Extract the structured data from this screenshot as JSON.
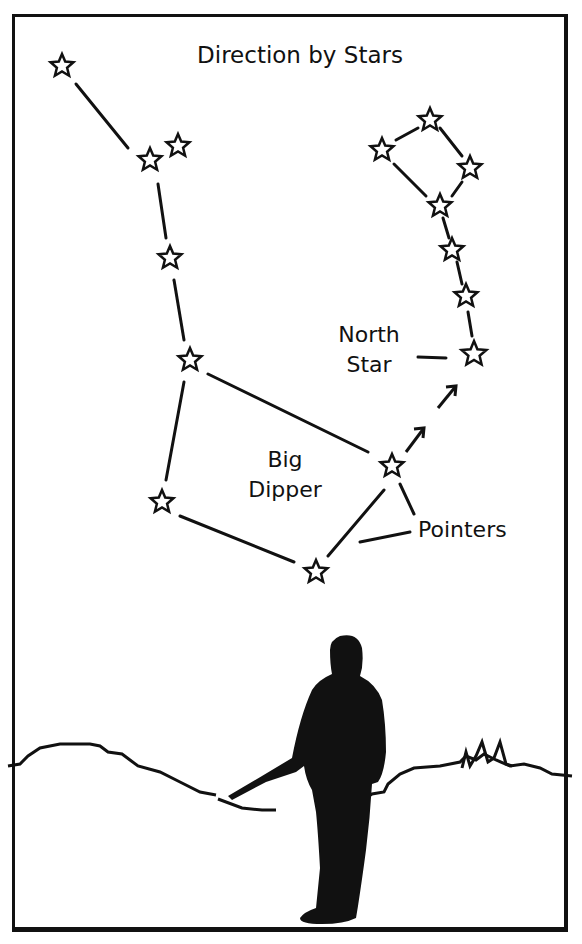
{
  "title": "Direction by Stars",
  "labels": {
    "north_star": "North\nStar",
    "north_line1": "North",
    "north_line2": "Star",
    "big_dipper_line1": "Big",
    "big_dipper_line2": "Dipper",
    "pointers": "Pointers"
  },
  "constellations": {
    "big_dipper": {
      "stars": [
        [
          62,
          66
        ],
        [
          150,
          160
        ],
        [
          178,
          146
        ],
        [
          170,
          258
        ],
        [
          190,
          360
        ],
        [
          162,
          502
        ],
        [
          316,
          572
        ],
        [
          392,
          466
        ]
      ],
      "lines": [
        [
          [
            76,
            84
          ],
          [
            128,
            148
          ]
        ],
        [
          [
            158,
            184
          ],
          [
            166,
            238
          ]
        ],
        [
          [
            174,
            280
          ],
          [
            184,
            340
          ]
        ],
        [
          [
            184,
            382
          ],
          [
            166,
            480
          ]
        ],
        [
          [
            208,
            374
          ],
          [
            368,
            452
          ]
        ],
        [
          [
            180,
            516
          ],
          [
            294,
            562
          ]
        ],
        [
          [
            328,
            556
          ],
          [
            384,
            490
          ]
        ]
      ]
    },
    "little_dipper": {
      "stars": [
        [
          382,
          150
        ],
        [
          430,
          120
        ],
        [
          470,
          168
        ],
        [
          440,
          206
        ],
        [
          452,
          250
        ],
        [
          466,
          296
        ],
        [
          474,
          354
        ]
      ],
      "lines": [
        [
          [
            396,
            140
          ],
          [
            418,
            128
          ]
        ],
        [
          [
            440,
            128
          ],
          [
            462,
            156
          ]
        ],
        [
          [
            394,
            164
          ],
          [
            426,
            196
          ]
        ],
        [
          [
            462,
            182
          ],
          [
            452,
            196
          ]
        ],
        [
          [
            443,
            218
          ],
          [
            449,
            238
          ]
        ],
        [
          [
            457,
            262
          ],
          [
            462,
            284
          ]
        ],
        [
          [
            468,
            312
          ],
          [
            472,
            336
          ]
        ]
      ]
    }
  },
  "pointer_arrows": [
    [
      [
        406,
        452
      ],
      [
        424,
        428
      ]
    ],
    [
      [
        438,
        408
      ],
      [
        456,
        386
      ]
    ]
  ],
  "label_lines": {
    "north_star": [
      [
        418,
        357
      ],
      [
        446,
        358
      ]
    ],
    "pointers_upper": [
      [
        400,
        484
      ],
      [
        414,
        514
      ]
    ],
    "pointers_lower": [
      [
        360,
        542
      ],
      [
        410,
        532
      ]
    ]
  },
  "colors": {
    "ink": "#111111",
    "paper": "#ffffff"
  }
}
